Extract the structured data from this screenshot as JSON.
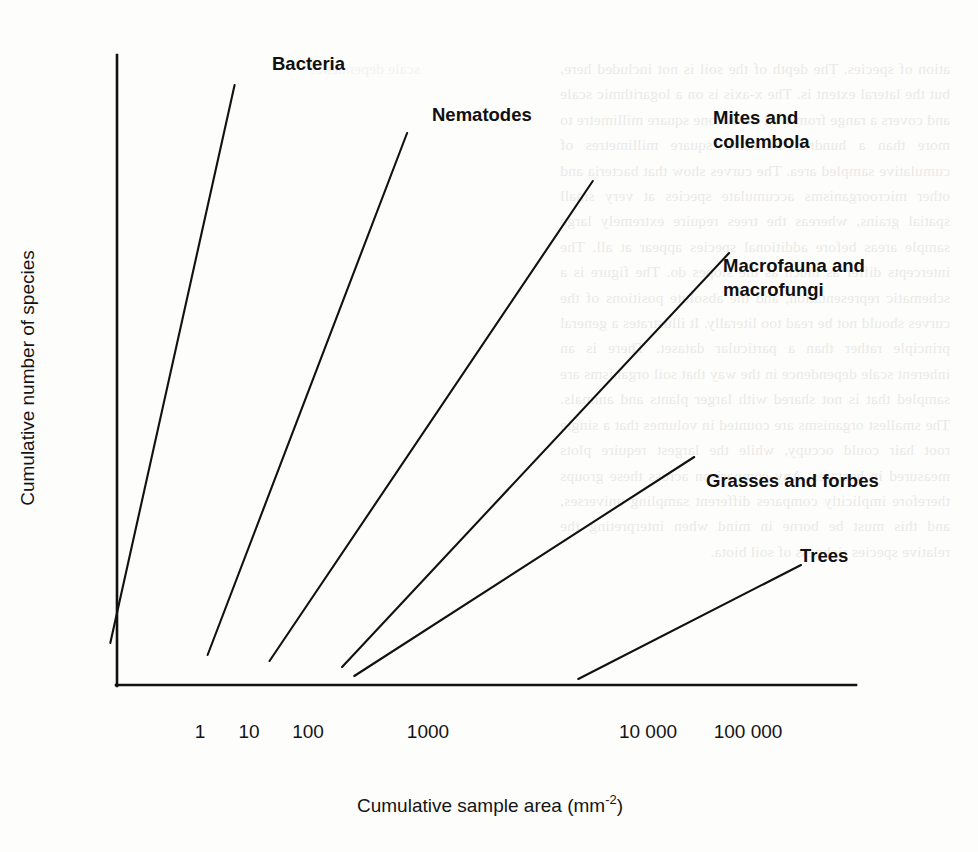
{
  "figure": {
    "background_color": "#fdfdfb",
    "ink_color": "#111111"
  },
  "chart_data": {
    "type": "line",
    "title": "",
    "xlabel": "Cumulative sample area (mm-2)",
    "xlabel_base": "Cumulative sample area (mm",
    "xlabel_exponent": "-2",
    "xlabel_close": ")",
    "ylabel": "Cumulative number of species",
    "x_scale": "log",
    "y_scale": "linear",
    "x_ticks": [
      "1",
      "10",
      "100",
      "1000",
      "10 000",
      "100 000"
    ],
    "x_tick_values": [
      1,
      10,
      100,
      1000,
      10000,
      100000
    ],
    "y_ticks": [],
    "grid": false,
    "legend_position": "inline-labels",
    "axis_ranges": {
      "x_min_label": "0.3",
      "x_max_label": "300 000",
      "y_min_label": "0",
      "y_max_label": "unlabelled"
    },
    "series": [
      {
        "name": "Bacteria",
        "label": "Bacteria",
        "start": {
          "x": 0.55,
          "y": 7
        },
        "end": {
          "x": 6.5,
          "y": 100
        },
        "slope_description": "steepest; rises from just below 1 mm-2 to very high species counts by ~6 mm-2"
      },
      {
        "name": "Nematodes",
        "label": "Nematodes",
        "start": {
          "x": 3.8,
          "y": 5
        },
        "end": {
          "x": 200,
          "y": 92
        },
        "slope_description": "second steepest; spans roughly 4 to 200 mm-2"
      },
      {
        "name": "Mites and collembola",
        "label": "Mites and collembola",
        "start": {
          "x": 13,
          "y": 4
        },
        "end": {
          "x": 8000,
          "y": 84
        },
        "slope_description": "spans roughly 13 to 8000 mm-2"
      },
      {
        "name": "Macrofauna and macrofungi",
        "label": "Macrofauna and macrofungi",
        "start": {
          "x": 55,
          "y": 3
        },
        "end": {
          "x": 120000,
          "y": 72
        },
        "slope_description": "spans roughly 55 mm-2 to above 100 000 mm-2"
      },
      {
        "name": "Grasses and forbes",
        "label": "Grasses and forbes",
        "start": {
          "x": 70,
          "y": 1.5
        },
        "end": {
          "x": 60000,
          "y": 38
        },
        "slope_description": "shallow; spans roughly 70 to 60 000 mm-2"
      },
      {
        "name": "Trees",
        "label": "Trees",
        "start": {
          "x": 6000,
          "y": 1
        },
        "end": {
          "x": 500000,
          "y": 20
        },
        "slope_description": "shallowest; begins near 6000 mm-2 and rises slowly"
      }
    ],
    "annotations": [
      {
        "text": "Bacteria",
        "attached_to": "Bacteria"
      },
      {
        "text": "Nematodes",
        "attached_to": "Nematodes"
      },
      {
        "text": "Mites and",
        "attached_to": "Mites and collembola"
      },
      {
        "text": "collembola",
        "attached_to": "Mites and collembola"
      },
      {
        "text": "Macrofauna and",
        "attached_to": "Macrofauna and macrofungi"
      },
      {
        "text": "macrofungi",
        "attached_to": "Macrofauna and macrofungi"
      },
      {
        "text": "Grasses and forbes",
        "attached_to": "Grasses and forbes"
      },
      {
        "text": "Trees",
        "attached_to": "Trees"
      }
    ]
  },
  "labels": {
    "bacteria": "Bacteria",
    "nematodes": "Nematodes",
    "mites_line1": "Mites and",
    "mites_line2": "collembola",
    "macro_line1": "Macrofauna and",
    "macro_line2": "macrofungi",
    "grasses": "Grasses and forbes",
    "trees": "Trees"
  },
  "ticks": {
    "t1": "1",
    "t2": "10",
    "t3": "100",
    "t4": "1000",
    "t5": "10 000",
    "t6": "100 000"
  },
  "axis_titles": {
    "x_base": "Cumulative sample area (mm",
    "x_exp": "-2",
    "x_close": ")",
    "y": "Cumulative number of species"
  },
  "page_bleed": {
    "right_column": "ation of species. The depth of the soil is not included here, but the lateral extent is. The x-axis is on a logarithmic scale and covers a range from well below one square millimetre to more than a hundred thousand square millimetres of cumulative sampled area. The curves show that bacteria and other microorganisms accumulate species at very small spatial grains, whereas the trees require extremely large sample areas before additional species appear at all. The intercepts differ as much as the slopes do. The figure is a schematic representation, and the absolute positions of the curves should not be read too literally. It illustrates a general principle rather than a particular dataset. There is an inherent scale dependence in the way that soil organisms are sampled that is not shared with larger plants and animals. The smallest organisms are counted in volumes that a single root hair could occupy, while the largest require plots measured in hectares. Any comparison across these groups therefore implicitly compares different sampling universes, and this must be borne in mind when interpreting the relative species richness of soil biota.",
    "left_column": "scale dependence"
  }
}
